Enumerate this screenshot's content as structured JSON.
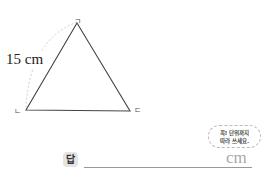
{
  "problem": {
    "side_length_label": "15 cm",
    "vertices": {
      "top": "ㄱ",
      "bottom_left": "ㄴ",
      "bottom_right": "ㄷ"
    },
    "answer_label": "답",
    "answer_unit": "cm",
    "hint_bubble": {
      "line1": "꼭! 단위까지",
      "line2": "따라 쓰세요."
    }
  },
  "colors": {
    "line": "#444444",
    "arc": "#cccccc",
    "answer_badge_bg": "#e4e4e4",
    "unit": "#aaaaaa"
  }
}
